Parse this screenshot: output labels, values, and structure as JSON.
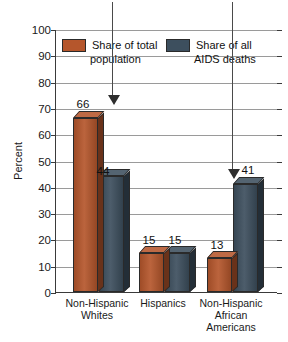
{
  "title": "A Picture of Difference",
  "chart_data": {
    "type": "bar",
    "title": "A Picture of Difference",
    "xlabel": "",
    "ylabel": "Percent",
    "ylim": [
      0,
      100
    ],
    "ytick_step": 10,
    "yticks": [
      "100",
      "90",
      "80",
      "70",
      "60",
      "50",
      "40",
      "30",
      "20",
      "10",
      "0"
    ],
    "grid": true,
    "legend_position": "top-inside",
    "categories": [
      "Non-Hispanic Whites",
      "Hispanics",
      "Non-Hispanic African Americans"
    ],
    "category_lines": [
      [
        "Non-Hispanic",
        "Whites"
      ],
      [
        "Hispanics"
      ],
      [
        "Non-Hispanic",
        "African",
        "Americans"
      ]
    ],
    "series": [
      {
        "name": "Share of total population",
        "name_line1": "Share of total",
        "name_line2": "population",
        "color": "#B5562C",
        "values": [
          66,
          15,
          13
        ],
        "labels": [
          "66",
          "15",
          "13"
        ]
      },
      {
        "name": "Share of all AIDS deaths",
        "name_line1": "Share of all",
        "name_line2": "AIDS deaths",
        "color": "#3D4F5E",
        "values": [
          44,
          15,
          41
        ],
        "labels": [
          "44",
          "15",
          "41"
        ]
      }
    ],
    "annotations": [
      {
        "name": "arrow-to-white-population",
        "points_to": "66",
        "glyph": "down-arrow"
      },
      {
        "name": "arrow-to-black-aids-deaths",
        "points_to": "41",
        "glyph": "down-arrow"
      }
    ]
  }
}
